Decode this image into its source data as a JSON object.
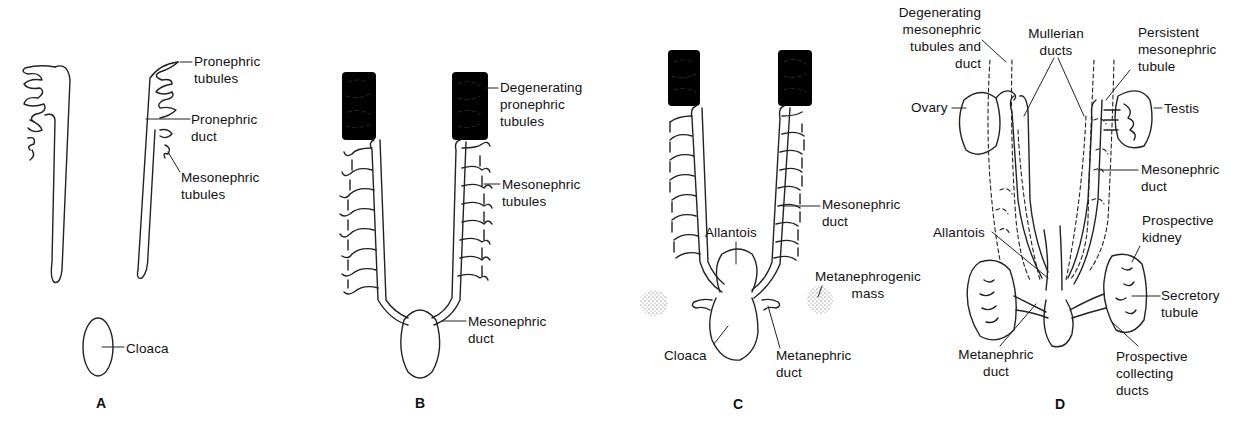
{
  "figure": {
    "background_color": "#ffffff",
    "line_color": "#222222"
  },
  "panels": {
    "A": {
      "letter": "A",
      "labels": {
        "pronephric_tubules": [
          "Pronephric",
          "tubules"
        ],
        "pronephric_duct": [
          "Pronephric",
          "duct"
        ],
        "mesonephric_tubules": [
          "Mesonephric",
          "tubules"
        ],
        "cloaca": "Cloaca"
      }
    },
    "B": {
      "letter": "B",
      "labels": {
        "degenerating_pronephric_tubules": [
          "Degenerating",
          "pronephric",
          "tubules"
        ],
        "mesonephric_tubules": [
          "Mesonephric",
          "tubules"
        ],
        "mesonephric_duct": [
          "Mesonephric",
          "duct"
        ]
      }
    },
    "C": {
      "letter": "C",
      "labels": {
        "mesonephric_duct": [
          "Mesonephric",
          "duct"
        ],
        "allantois": "Allantois",
        "metanephrogenic_mass": [
          "Metanephrogenic",
          "mass"
        ],
        "cloaca": "Cloaca",
        "metanephric_duct": [
          "Metanephric",
          "duct"
        ]
      }
    },
    "D": {
      "letter": "D",
      "labels": {
        "degenerating_mesonephric": [
          "Degenerating",
          "mesonephric",
          "tubules and",
          "duct"
        ],
        "mullerian_ducts": [
          "Mullerian",
          "ducts"
        ],
        "persistent_mesonephric_tubule": [
          "Persistent",
          "mesonephric",
          "tubule"
        ],
        "ovary": "Ovary",
        "testis": "Testis",
        "mesonephric_duct": [
          "Mesonephric",
          "duct"
        ],
        "allantois": "Allantois",
        "prospective_kidney": [
          "Prospective",
          "kidney"
        ],
        "secretory_tubule": [
          "Secretory",
          "tubule"
        ],
        "metanephric_duct": [
          "Metanephric",
          "duct"
        ],
        "prospective_collecting_ducts": [
          "Prospective",
          "collecting",
          "ducts"
        ]
      }
    }
  }
}
